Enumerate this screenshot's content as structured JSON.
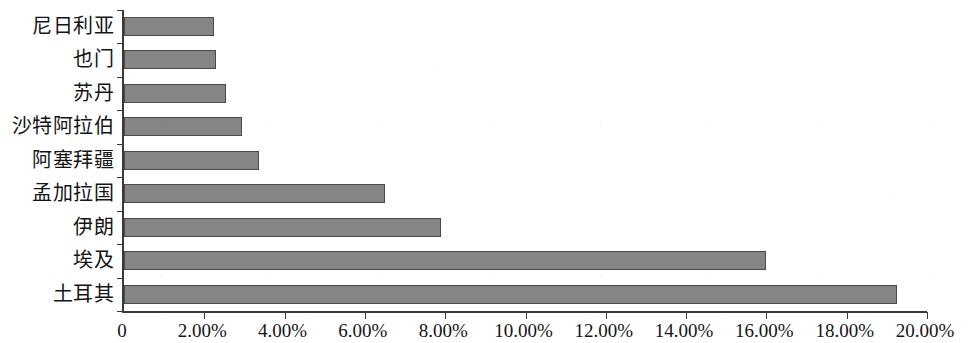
{
  "chart_data": {
    "type": "bar",
    "orientation": "horizontal",
    "title": "",
    "subtitle": "",
    "xlabel": "",
    "ylabel": "",
    "categories": [
      "尼日利亚",
      "也门",
      "苏丹",
      "沙特阿拉伯",
      "阿塞拜疆",
      "孟加拉国",
      "伊朗",
      "埃及",
      "土耳其"
    ],
    "values": [
      2.25,
      2.3,
      2.55,
      2.95,
      3.35,
      6.5,
      7.9,
      16.0,
      19.25
    ],
    "value_unit": "%",
    "xlim": [
      0,
      20
    ],
    "xtick_values": [
      0,
      2,
      4,
      6,
      8,
      10,
      12,
      14,
      16,
      18,
      20
    ],
    "xtick_labels": [
      "0",
      "2.00%",
      "4.00%",
      "6.00%",
      "8.00%",
      "10.00%",
      "12.00%",
      "14.00%",
      "16.00%",
      "18.00%",
      "20.00%"
    ],
    "grid": false,
    "legend": false,
    "legend_position": "none",
    "series": [
      {
        "name": "",
        "values": [
          2.25,
          2.3,
          2.55,
          2.95,
          3.35,
          6.5,
          7.9,
          16.0,
          19.25
        ]
      }
    ],
    "colors": {
      "bar_fill": "#858585",
      "bar_border": "#4a4a4a",
      "axis": "#3a3a3a",
      "text": "#151515",
      "background": "#ffffff"
    }
  }
}
